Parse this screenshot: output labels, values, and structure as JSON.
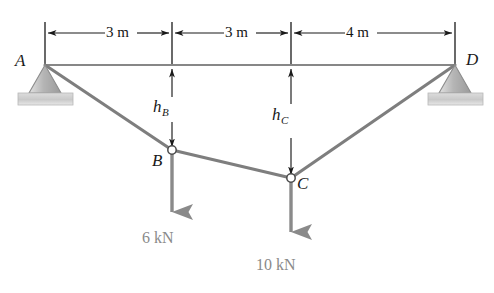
{
  "figure": {
    "colors": {
      "cable": "#7e7e7e",
      "reference_line": "#5f5f5f",
      "dimension_line": "#1a1a1a",
      "load_arrow": "#8a8a8a",
      "support_fill_light": "#d8d8d8",
      "support_fill_dark": "#a9a9a9",
      "ground_fill": "#cfcfcf",
      "text_dark": "#141414",
      "text_gray": "#8a8a8a"
    },
    "supports": [
      {
        "name": "support-a",
        "label": "A",
        "type": "pin",
        "x": 45,
        "y": 65
      },
      {
        "name": "support-d",
        "label": "D",
        "type": "pin",
        "x": 455,
        "y": 65
      }
    ],
    "joints": [
      {
        "name": "joint-a",
        "label": "A",
        "x": 45,
        "y": 65
      },
      {
        "name": "joint-b",
        "label": "B",
        "x": 172,
        "y": 150
      },
      {
        "name": "joint-c",
        "label": "C",
        "x": 291,
        "y": 178
      },
      {
        "name": "joint-d",
        "label": "D",
        "x": 455,
        "y": 65
      }
    ],
    "dimensions": [
      {
        "name": "span-ab",
        "label": "3 m",
        "from_x": 45,
        "to_x": 172
      },
      {
        "name": "span-bc",
        "label": "3 m",
        "from_x": 172,
        "to_x": 291
      },
      {
        "name": "span-cd",
        "label": "4 m",
        "from_x": 291,
        "to_x": 455
      }
    ],
    "heights": [
      {
        "name": "height-b",
        "label": "h",
        "subscript": "B",
        "x": 172,
        "from_y": 65,
        "to_y": 150
      },
      {
        "name": "height-c",
        "label": "h",
        "subscript": "C",
        "x": 291,
        "from_y": 65,
        "to_y": 178
      }
    ],
    "loads": [
      {
        "name": "load-b",
        "label": "6 kN",
        "value": 6,
        "unit": "kN",
        "at_joint": "B",
        "x": 172,
        "from_y": 150,
        "to_y": 232,
        "direction": "down"
      },
      {
        "name": "load-c",
        "label": "10 kN",
        "value": 10,
        "unit": "kN",
        "at_joint": "C",
        "x": 291,
        "from_y": 178,
        "to_y": 252,
        "direction": "down"
      }
    ],
    "segments": [
      {
        "name": "cable-ab",
        "from": "A",
        "to": "B"
      },
      {
        "name": "cable-bc",
        "from": "B",
        "to": "C"
      },
      {
        "name": "cable-cd",
        "from": "C",
        "to": "D"
      }
    ],
    "labels": {
      "a": "A",
      "b": "B",
      "c": "C",
      "d": "D",
      "dim_ab": "3 m",
      "dim_bc": "3 m",
      "dim_cd": "4 m",
      "h_b_base": "h",
      "h_b_sub": "B",
      "h_c_base": "h",
      "h_c_sub": "C",
      "load_b": "6 kN",
      "load_c": "10 kN"
    }
  }
}
